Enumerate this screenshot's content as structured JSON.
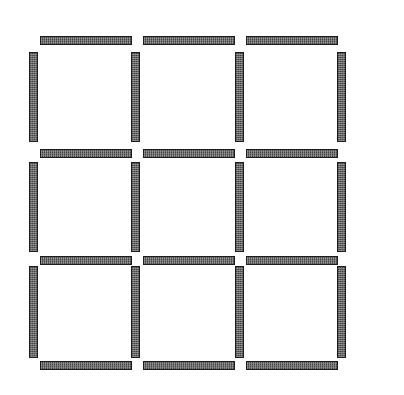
{
  "figure": {
    "background_color": "#ffffff",
    "canvas": {
      "width": 404,
      "height": 395
    }
  },
  "style": {
    "stick_fill": "#5a5a5a",
    "stick_border": "#1c1c1c",
    "stick_thickness": 9,
    "stick_length": 92
  },
  "counts": {
    "total_matchsticks": 24,
    "horizontal_matchsticks": 12,
    "vertical_matchsticks": 12,
    "squares": 9,
    "rows": 3,
    "columns": 3
  },
  "grid": {
    "horizontal_rows_y": [
      36,
      149,
      256,
      361
    ],
    "horizontal_columns_x": [
      40,
      143,
      246
    ],
    "vertical_columns_x": [
      29,
      131,
      235,
      337
    ],
    "vertical_rows_y": [
      52,
      162,
      266
    ]
  },
  "matchsticks": [
    {
      "id": "h-r0-c0",
      "orientation": "horizontal",
      "row": 0,
      "col": 0,
      "x": 40,
      "y": 36,
      "w": 92,
      "h": 9
    },
    {
      "id": "h-r0-c1",
      "orientation": "horizontal",
      "row": 0,
      "col": 1,
      "x": 143,
      "y": 36,
      "w": 92,
      "h": 9
    },
    {
      "id": "h-r0-c2",
      "orientation": "horizontal",
      "row": 0,
      "col": 2,
      "x": 246,
      "y": 36,
      "w": 92,
      "h": 9
    },
    {
      "id": "h-r1-c0",
      "orientation": "horizontal",
      "row": 1,
      "col": 0,
      "x": 40,
      "y": 149,
      "w": 92,
      "h": 9
    },
    {
      "id": "h-r1-c1",
      "orientation": "horizontal",
      "row": 1,
      "col": 1,
      "x": 143,
      "y": 149,
      "w": 92,
      "h": 9
    },
    {
      "id": "h-r1-c2",
      "orientation": "horizontal",
      "row": 1,
      "col": 2,
      "x": 246,
      "y": 149,
      "w": 92,
      "h": 9
    },
    {
      "id": "h-r2-c0",
      "orientation": "horizontal",
      "row": 2,
      "col": 0,
      "x": 40,
      "y": 256,
      "w": 92,
      "h": 9
    },
    {
      "id": "h-r2-c1",
      "orientation": "horizontal",
      "row": 2,
      "col": 1,
      "x": 143,
      "y": 256,
      "w": 92,
      "h": 9
    },
    {
      "id": "h-r2-c2",
      "orientation": "horizontal",
      "row": 2,
      "col": 2,
      "x": 246,
      "y": 256,
      "w": 92,
      "h": 9
    },
    {
      "id": "h-r3-c0",
      "orientation": "horizontal",
      "row": 3,
      "col": 0,
      "x": 40,
      "y": 361,
      "w": 92,
      "h": 9
    },
    {
      "id": "h-r3-c1",
      "orientation": "horizontal",
      "row": 3,
      "col": 1,
      "x": 143,
      "y": 361,
      "w": 92,
      "h": 9
    },
    {
      "id": "h-r3-c2",
      "orientation": "horizontal",
      "row": 3,
      "col": 2,
      "x": 246,
      "y": 361,
      "w": 92,
      "h": 9
    },
    {
      "id": "v-r0-c0",
      "orientation": "vertical",
      "row": 0,
      "col": 0,
      "x": 29,
      "y": 52,
      "w": 9,
      "h": 90
    },
    {
      "id": "v-r0-c1",
      "orientation": "vertical",
      "row": 0,
      "col": 1,
      "x": 131,
      "y": 52,
      "w": 9,
      "h": 90
    },
    {
      "id": "v-r0-c2",
      "orientation": "vertical",
      "row": 0,
      "col": 2,
      "x": 235,
      "y": 52,
      "w": 9,
      "h": 90
    },
    {
      "id": "v-r0-c3",
      "orientation": "vertical",
      "row": 0,
      "col": 3,
      "x": 337,
      "y": 52,
      "w": 9,
      "h": 90
    },
    {
      "id": "v-r1-c0",
      "orientation": "vertical",
      "row": 1,
      "col": 0,
      "x": 29,
      "y": 162,
      "w": 9,
      "h": 90
    },
    {
      "id": "v-r1-c1",
      "orientation": "vertical",
      "row": 1,
      "col": 1,
      "x": 131,
      "y": 162,
      "w": 9,
      "h": 90
    },
    {
      "id": "v-r1-c2",
      "orientation": "vertical",
      "row": 1,
      "col": 2,
      "x": 235,
      "y": 162,
      "w": 9,
      "h": 90
    },
    {
      "id": "v-r1-c3",
      "orientation": "vertical",
      "row": 1,
      "col": 3,
      "x": 337,
      "y": 162,
      "w": 9,
      "h": 90
    },
    {
      "id": "v-r2-c0",
      "orientation": "vertical",
      "row": 2,
      "col": 0,
      "x": 29,
      "y": 266,
      "w": 9,
      "h": 92
    },
    {
      "id": "v-r2-c1",
      "orientation": "vertical",
      "row": 2,
      "col": 1,
      "x": 131,
      "y": 266,
      "w": 9,
      "h": 92
    },
    {
      "id": "v-r2-c2",
      "orientation": "vertical",
      "row": 2,
      "col": 2,
      "x": 235,
      "y": 266,
      "w": 9,
      "h": 92
    },
    {
      "id": "v-r2-c3",
      "orientation": "vertical",
      "row": 2,
      "col": 3,
      "x": 337,
      "y": 266,
      "w": 9,
      "h": 92
    }
  ]
}
